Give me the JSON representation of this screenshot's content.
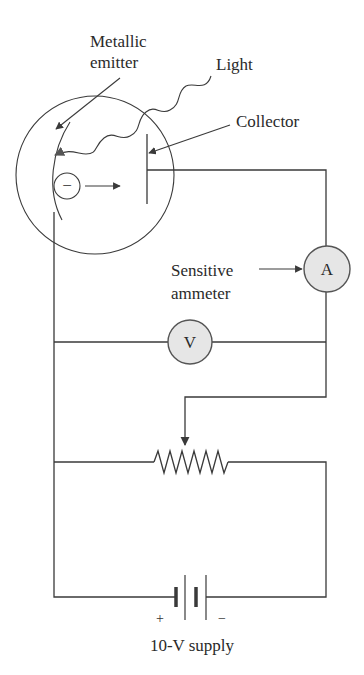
{
  "diagram": {
    "labels": {
      "metallic_emitter_line1": "Metallic",
      "metallic_emitter_line2": "emitter",
      "light": "Light",
      "collector": "Collector",
      "sensitive_ammeter_line1": "Sensitive",
      "sensitive_ammeter_line2": "ammeter",
      "supply": "10-V supply"
    },
    "components": {
      "ammeter": {
        "symbol": "A"
      },
      "voltmeter": {
        "symbol": "V"
      },
      "electron": {
        "symbol": "−"
      },
      "battery": {
        "positive": "+",
        "negative": "−"
      }
    },
    "colors": {
      "line": "#3a3a3a",
      "meter_fill": "#e6e6e6",
      "background": "#ffffff"
    }
  }
}
